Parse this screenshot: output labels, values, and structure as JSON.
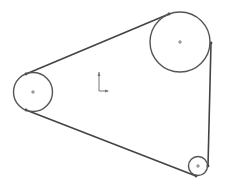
{
  "diagram": {
    "type": "belt-pulley-sketch",
    "colors": {
      "background": "#ffffff",
      "stroke": "#555555",
      "belt": "#444444",
      "axis": "#777777"
    },
    "pulleys": [
      {
        "name": "large-pulley",
        "cx": 180,
        "cy": 42,
        "r": 30
      },
      {
        "name": "left-pulley",
        "cx": 33,
        "cy": 92,
        "r": 19.5
      },
      {
        "name": "small-pulley",
        "cx": 198,
        "cy": 166,
        "r": 9.5
      }
    ],
    "belt_segments": [
      {
        "name": "belt-top",
        "x1": 26,
        "y1": 74,
        "x2": 169,
        "y2": 14
      },
      {
        "name": "belt-bottom",
        "x1": 26,
        "y1": 110,
        "x2": 196,
        "y2": 176
      },
      {
        "name": "belt-right",
        "x1": 211,
        "y1": 43,
        "x2": 208,
        "y2": 166
      }
    ],
    "origin_axes": {
      "x": 99,
      "y": 91,
      "length": 19
    }
  }
}
